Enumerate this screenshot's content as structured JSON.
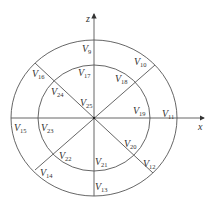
{
  "diagram": {
    "axes": {
      "x_label": "x",
      "z_label": "z"
    },
    "caption": "",
    "outer_ring_labels": [
      {
        "id": "V9",
        "base": "V",
        "sub": "9",
        "x": 82,
        "y": 52
      },
      {
        "id": "V10",
        "base": "V",
        "sub": "10",
        "x": 134,
        "y": 65
      },
      {
        "id": "V11",
        "base": "V",
        "sub": "11",
        "x": 162,
        "y": 117
      },
      {
        "id": "V12",
        "base": "V",
        "sub": "12",
        "x": 143,
        "y": 167
      },
      {
        "id": "V13",
        "base": "V",
        "sub": "13",
        "x": 95,
        "y": 190
      },
      {
        "id": "V14",
        "base": "V",
        "sub": "14",
        "x": 40,
        "y": 176
      },
      {
        "id": "V15",
        "base": "V",
        "sub": "15",
        "x": 14,
        "y": 131
      },
      {
        "id": "V16",
        "base": "V",
        "sub": "16",
        "x": 32,
        "y": 77
      }
    ],
    "inner_ring_labels": [
      {
        "id": "V17",
        "base": "V",
        "sub": "17",
        "x": 78,
        "y": 76
      },
      {
        "id": "V18",
        "base": "V",
        "sub": "18",
        "x": 115,
        "y": 82
      },
      {
        "id": "V19",
        "base": "V",
        "sub": "19",
        "x": 133,
        "y": 114
      },
      {
        "id": "V20",
        "base": "V",
        "sub": "20",
        "x": 124,
        "y": 147
      },
      {
        "id": "V21",
        "base": "V",
        "sub": "21",
        "x": 95,
        "y": 165
      },
      {
        "id": "V22",
        "base": "V",
        "sub": "22",
        "x": 59,
        "y": 159
      },
      {
        "id": "V23",
        "base": "V",
        "sub": "23",
        "x": 41,
        "y": 131
      },
      {
        "id": "V24",
        "base": "V",
        "sub": "24",
        "x": 51,
        "y": 95
      }
    ],
    "center_label": {
      "id": "V25",
      "base": "V",
      "sub": "25",
      "x": 80,
      "y": 106
    }
  }
}
